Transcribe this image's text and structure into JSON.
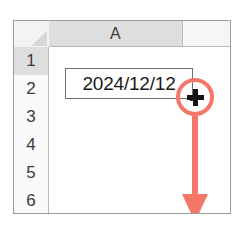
{
  "app": {
    "kind": "spreadsheet",
    "description": "Spreadsheet fill-handle drag annotation"
  },
  "grid": {
    "select_all_corner_label": "",
    "column_headers": [
      {
        "label": "A",
        "selected": true
      }
    ],
    "row_headers": [
      {
        "label": "1",
        "active": true
      },
      {
        "label": "2",
        "active": false
      },
      {
        "label": "3",
        "active": false
      },
      {
        "label": "4",
        "active": false
      },
      {
        "label": "5",
        "active": false
      },
      {
        "label": "6",
        "active": false
      }
    ],
    "cells": [
      {
        "ref": "A1",
        "value": "2024/12/12",
        "selected": true
      },
      {
        "ref": "A2",
        "value": ""
      },
      {
        "ref": "A3",
        "value": ""
      },
      {
        "ref": "A4",
        "value": ""
      },
      {
        "ref": "A5",
        "value": ""
      },
      {
        "ref": "A6",
        "value": ""
      }
    ]
  },
  "annotations": {
    "highlight_circle": {
      "name": "fill-handle-highlight",
      "color": "#f4776a",
      "target": "fill-handle"
    },
    "cursor": {
      "name": "fill-crosshair-cursor",
      "glyph": "plus",
      "color": "#141414"
    },
    "drag_arrow": {
      "name": "drag-down-arrow",
      "direction": "down",
      "color": "#f4776a"
    }
  },
  "colors": {
    "accent": "#f4776a",
    "header_selected": "#dedede",
    "grid_line": "#b9b9b9",
    "frame_border": "#9b9b9b",
    "text": "#1a1a1a"
  }
}
